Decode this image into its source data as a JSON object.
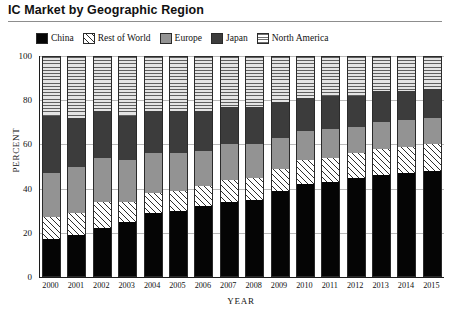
{
  "header": {
    "title": "IC Market by Geographic Region"
  },
  "axis": {
    "y_title": "PERCENT",
    "x_title": "YEAR",
    "y_ticks": [
      "100",
      "80",
      "60",
      "40",
      "20",
      "0"
    ]
  },
  "legend": {
    "items": [
      {
        "label": "China",
        "swatch": "solid-black-swatch",
        "color": "#050505"
      },
      {
        "label": "Rest of World",
        "swatch": "diagonal-hatch-swatch",
        "color": "#ffffff"
      },
      {
        "label": "Europe",
        "swatch": "medium-gray-swatch",
        "color": "#939393"
      },
      {
        "label": "Japan",
        "swatch": "dark-gray-swatch",
        "color": "#3c3c3c"
      },
      {
        "label": "North America",
        "swatch": "horizontal-stripe-swatch",
        "color": "#d8d8d8"
      }
    ]
  },
  "chart_data": {
    "type": "bar",
    "stacked": true,
    "title": "IC Market by Geographic Region",
    "xlabel": "YEAR",
    "ylabel": "PERCENT",
    "ylim": [
      0,
      100
    ],
    "yticks": [
      0,
      20,
      40,
      60,
      80,
      100
    ],
    "grid": true,
    "legend_position": "top",
    "categories": [
      "2000",
      "2001",
      "2002",
      "2003",
      "2004",
      "2005",
      "2006",
      "2007",
      "2008",
      "2009",
      "2010",
      "2011",
      "2012",
      "2013",
      "2014",
      "2015"
    ],
    "series": [
      {
        "name": "China",
        "color": "#050505",
        "pattern": "solid",
        "values": [
          17,
          19,
          22,
          25,
          29,
          30,
          32,
          34,
          35,
          39,
          42,
          43,
          45,
          46,
          47,
          48
        ]
      },
      {
        "name": "Rest of World",
        "color": "#ffffff",
        "pattern": "diagonal-hatch",
        "values": [
          10,
          10,
          12,
          9,
          9,
          9,
          9,
          10,
          10,
          10,
          11,
          11,
          11,
          12,
          12,
          12
        ]
      },
      {
        "name": "Europe",
        "color": "#939393",
        "pattern": "solid",
        "values": [
          20,
          21,
          20,
          19,
          18,
          17,
          16,
          16,
          15,
          14,
          13,
          13,
          12,
          12,
          12,
          12
        ]
      },
      {
        "name": "Japan",
        "color": "#3c3c3c",
        "pattern": "solid",
        "values": [
          26,
          22,
          21,
          20,
          19,
          19,
          18,
          17,
          17,
          16,
          15,
          15,
          14,
          14,
          13,
          13
        ]
      },
      {
        "name": "North America",
        "color": "#d8d8d8",
        "pattern": "horizontal-stripe",
        "values": [
          27,
          28,
          25,
          27,
          25,
          25,
          25,
          23,
          23,
          21,
          19,
          18,
          18,
          16,
          16,
          15
        ]
      }
    ]
  }
}
